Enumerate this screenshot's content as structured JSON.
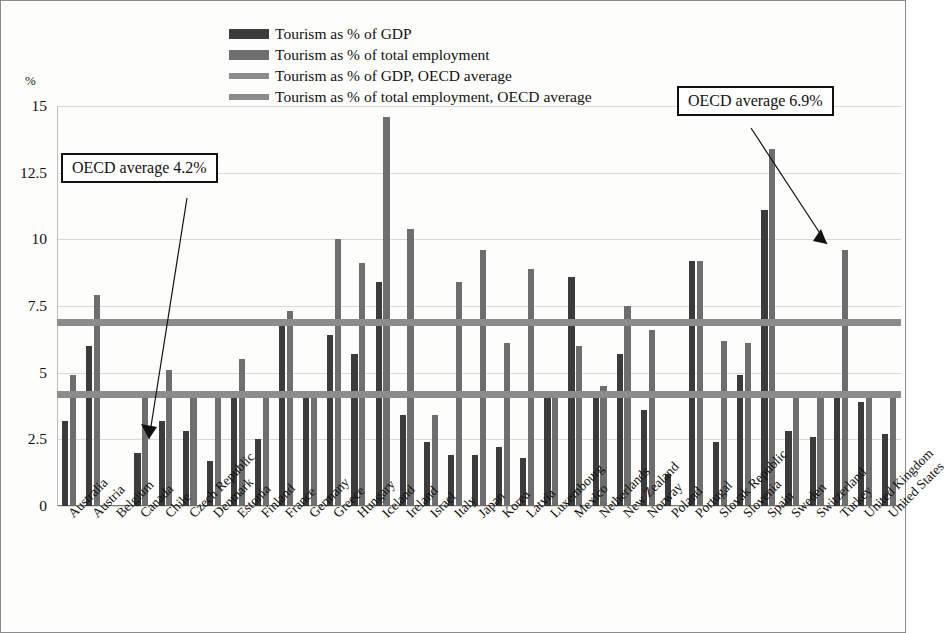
{
  "figure": {
    "y_axis_unit": "%",
    "y_ticks": [
      "0",
      "2.5",
      "5",
      "7.5",
      "10",
      "12.5",
      "15"
    ]
  },
  "legend": {
    "items": [
      {
        "label": "Tourism as % of GDP",
        "type": "bar",
        "color": "#3b3b3b",
        "icon": "legend-swatch-gdp"
      },
      {
        "label": "Tourism as % of total employment",
        "type": "bar",
        "color": "#6e6e6e",
        "icon": "legend-swatch-employment"
      },
      {
        "label": "Tourism as % of GDP, OECD average",
        "type": "line",
        "color": "#8c8c8c",
        "icon": "legend-line-gdp-average"
      },
      {
        "label": "Tourism as % of total employment, OECD average",
        "type": "line",
        "color": "#8c8c8c",
        "icon": "legend-line-employment-average"
      }
    ]
  },
  "callouts": {
    "gdp_average": "OECD average 4.2%",
    "employment_average": "OECD average 6.9%"
  },
  "chart_data": {
    "type": "bar",
    "title": "",
    "subtitle": "",
    "xlabel": "",
    "ylabel": "%",
    "ylim": [
      0,
      15
    ],
    "yticks": [
      0,
      2.5,
      5,
      7.5,
      10,
      12.5,
      15
    ],
    "grid": true,
    "legend_position": "top-center",
    "categories": [
      "Australia",
      "Austria",
      "Belgium",
      "Canada",
      "Chile",
      "Czech Republic",
      "Denmark",
      "Estonia",
      "Finland",
      "France",
      "Germany",
      "Greece",
      "Hungary",
      "Iceland",
      "Ireland",
      "Israel",
      "Italy",
      "Japan",
      "Korea",
      "Latvia",
      "Luxembourg",
      "Mexico",
      "Netherlands",
      "New Zealand",
      "Norway",
      "Poland",
      "Portugal",
      "Slovak Republic",
      "Slovenia",
      "Spain",
      "Sweden",
      "Switzerland",
      "Turkey",
      "United Kingdom",
      "United States"
    ],
    "series": [
      {
        "name": "Tourism as % of GDP",
        "color": "#3b3b3b",
        "values": [
          3.2,
          6.0,
          null,
          2.0,
          3.2,
          2.8,
          1.7,
          4.1,
          2.5,
          7.0,
          4.1,
          6.4,
          5.7,
          8.4,
          3.4,
          2.4,
          1.9,
          1.9,
          2.2,
          1.8,
          4.2,
          8.6,
          4.1,
          5.7,
          3.6,
          1.2,
          9.2,
          2.4,
          4.9,
          11.1,
          2.8,
          2.6,
          4.2,
          3.9,
          2.7
        ]
      },
      {
        "name": "Tourism as % of total employment",
        "color": "#6e6e6e",
        "values": [
          4.9,
          7.9,
          null,
          4.2,
          5.1,
          4.3,
          4.2,
          5.5,
          4.2,
          7.3,
          4.1,
          10.0,
          9.1,
          14.6,
          10.4,
          3.4,
          8.4,
          9.6,
          6.1,
          8.9,
          4.2,
          6.0,
          4.5,
          7.5,
          6.6,
          null,
          9.2,
          6.2,
          6.1,
          13.4,
          4.2,
          4.2,
          9.6,
          4.2,
          4.2
        ]
      }
    ],
    "reference_lines": [
      {
        "name": "Tourism as % of GDP, OECD average",
        "value": 4.2,
        "color": "#8c8c8c"
      },
      {
        "name": "Tourism as % of total employment, OECD average",
        "value": 6.9,
        "color": "#8c8c8c"
      }
    ],
    "annotations": [
      {
        "text": "OECD average 4.2%",
        "points_to": "Canada"
      },
      {
        "text": "OECD average 6.9%",
        "points_to": "Turkey"
      }
    ]
  }
}
